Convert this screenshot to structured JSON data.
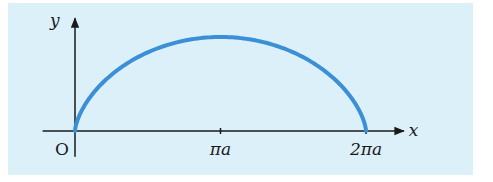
{
  "colors": {
    "background": "#dcf0fa",
    "curve": "#3b8fd6",
    "axes": "#1a1a1a"
  },
  "chart_data": {
    "type": "line",
    "title": "",
    "curve_kind": "cycloid (arch)",
    "parameter_a": 1,
    "parametric": {
      "x": "a(t - sin t)",
      "y": "a(1 - cos t)",
      "t_range": [
        0,
        6.283185307
      ]
    },
    "xlabel": "x",
    "ylabel": "y",
    "origin_label": "O",
    "x_ticks": [
      {
        "value": 3.141592654,
        "label": "πa"
      },
      {
        "value": 6.283185307,
        "label": "2πa"
      }
    ],
    "xlim": [
      -0.7,
      7.1
    ],
    "ylim": [
      -0.55,
      2.4
    ],
    "grid": false,
    "legend": "none"
  }
}
